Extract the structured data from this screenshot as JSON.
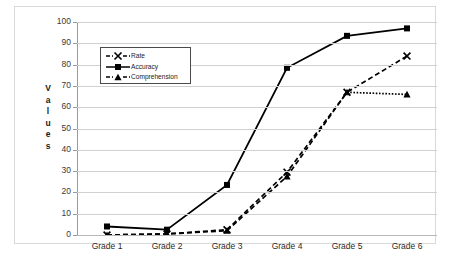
{
  "chart_data": {
    "type": "line",
    "title": "",
    "xlabel": "",
    "ylabel": "Values",
    "categories": [
      "Grade 1",
      "Grade 2",
      "Grade 3",
      "Grade 4",
      "Grade 5",
      "Grade 6"
    ],
    "ylim": [
      0,
      100
    ],
    "yticks": [
      0,
      10,
      20,
      30,
      40,
      50,
      60,
      70,
      80,
      90,
      100
    ],
    "grid": true,
    "legend_position": "upper-left-inside",
    "series": [
      {
        "name": "Rate",
        "marker": "x",
        "line_style": "dashed",
        "color": "#000000",
        "values": [
          0,
          0.5,
          2.5,
          29.5,
          67,
          84
        ]
      },
      {
        "name": "Accuracy",
        "marker": "square",
        "line_style": "solid",
        "color": "#000000",
        "values": [
          4,
          2.5,
          23.5,
          78.5,
          93.5,
          97
        ]
      },
      {
        "name": "Comprehension",
        "marker": "triangle",
        "line_style": "dashed",
        "color": "#000000",
        "values": [
          0,
          0.5,
          2,
          27.5,
          67,
          66
        ]
      }
    ]
  },
  "axis": {
    "y_title_letters": [
      "V",
      "a",
      "l",
      "u",
      "e",
      "s"
    ]
  }
}
